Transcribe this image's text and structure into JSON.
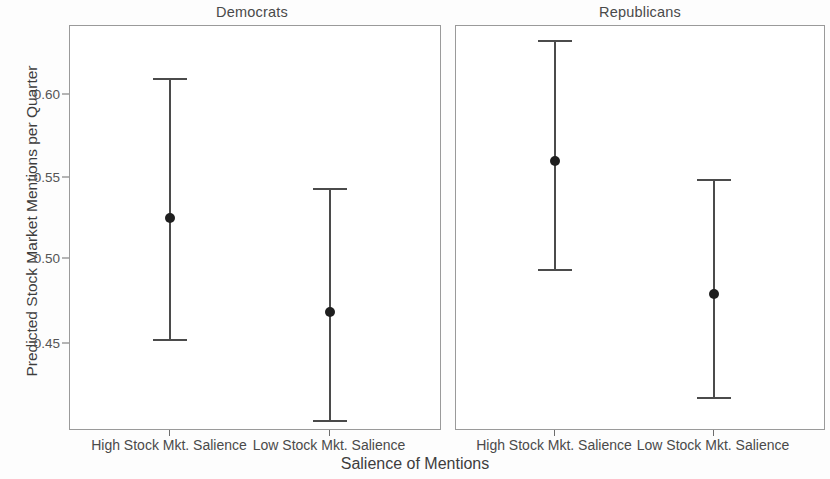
{
  "chart_data": {
    "type": "scatter",
    "subtype": "error-bar-point-range",
    "title": "",
    "xlabel": "Salience of Mentions",
    "ylabel": "Predicted Stock Market Mentions per Quarter",
    "ylim": [
      0.408,
      0.636
    ],
    "yticks": [
      0.45,
      0.5,
      0.55,
      0.6
    ],
    "ytick_labels": [
      "0.45",
      "0.50",
      "0.55",
      "0.60"
    ],
    "grid": false,
    "legend": "none",
    "facet_labels": [
      "Democrats",
      "Republicans"
    ],
    "categories": [
      "High Stock Mkt. Salience",
      "Low Stock Mkt. Salience"
    ],
    "panels": [
      {
        "label": "Democrats",
        "points": [
          {
            "category": "High Stock Mkt. Salience",
            "estimate": 0.528,
            "ci_low": 0.46,
            "ci_high": 0.607
          },
          {
            "category": "Low Stock Mkt. Salience",
            "estimate": 0.475,
            "ci_low": 0.414,
            "ci_high": 0.545
          }
        ]
      },
      {
        "label": "Republicans",
        "points": [
          {
            "category": "High Stock Mkt. Salience",
            "estimate": 0.56,
            "ci_low": 0.499,
            "ci_high": 0.628
          },
          {
            "category": "Low Stock Mkt. Salience",
            "estimate": 0.485,
            "ci_low": 0.427,
            "ci_high": 0.55
          }
        ]
      }
    ],
    "colors": {
      "point": "#1f1f1f",
      "errorbar": "#4b4b4b",
      "panel_border": "#9a9a9a",
      "text": "#3d3d3d",
      "background": "#ffffff"
    }
  },
  "axes": {
    "y_title": "Predicted Stock Market Mentions per Quarter",
    "x_title": "Salience of Mentions",
    "y_tick_labels": [
      "0.60",
      "0.55",
      "0.50",
      "0.45"
    ],
    "x_tick_labels": [
      "High Stock Mkt. Salience",
      "Low Stock Mkt. Salience"
    ]
  },
  "panels": {
    "left": {
      "title": "Democrats"
    },
    "right": {
      "title": "Republicans"
    }
  }
}
